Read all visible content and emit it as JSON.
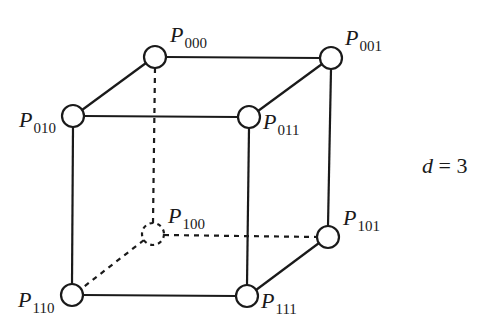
{
  "diagram": {
    "type": "hypercube",
    "dimension_label": {
      "var": "d",
      "op": " = ",
      "value": "3"
    },
    "colors": {
      "stroke": "#1a1a1a",
      "node_fill": "#ffffff",
      "background": "#ffffff"
    },
    "nodes": [
      {
        "id": "P000",
        "letter": "P",
        "sub": "000",
        "x": 155,
        "y": 57,
        "hidden": false
      },
      {
        "id": "P001",
        "letter": "P",
        "sub": "001",
        "x": 331,
        "y": 58,
        "hidden": false
      },
      {
        "id": "P010",
        "letter": "P",
        "sub": "010",
        "x": 73,
        "y": 116,
        "hidden": false
      },
      {
        "id": "P011",
        "letter": "P",
        "sub": "011",
        "x": 249,
        "y": 117,
        "hidden": false
      },
      {
        "id": "P100",
        "letter": "P",
        "sub": "100",
        "x": 153,
        "y": 234,
        "hidden": true
      },
      {
        "id": "P101",
        "letter": "P",
        "sub": "101",
        "x": 328,
        "y": 237,
        "hidden": false
      },
      {
        "id": "P110",
        "letter": "P",
        "sub": "110",
        "x": 72,
        "y": 295,
        "hidden": false
      },
      {
        "id": "P111",
        "letter": "P",
        "sub": "111",
        "x": 247,
        "y": 296,
        "hidden": false
      }
    ],
    "edges": [
      {
        "from": "P000",
        "to": "P001",
        "style": "solid"
      },
      {
        "from": "P000",
        "to": "P010",
        "style": "solid"
      },
      {
        "from": "P001",
        "to": "P011",
        "style": "solid"
      },
      {
        "from": "P010",
        "to": "P011",
        "style": "solid"
      },
      {
        "from": "P010",
        "to": "P110",
        "style": "solid"
      },
      {
        "from": "P011",
        "to": "P111",
        "style": "solid"
      },
      {
        "from": "P001",
        "to": "P101",
        "style": "solid"
      },
      {
        "from": "P110",
        "to": "P111",
        "style": "solid"
      },
      {
        "from": "P111",
        "to": "P101",
        "style": "solid"
      },
      {
        "from": "P000",
        "to": "P100",
        "style": "dashed"
      },
      {
        "from": "P100",
        "to": "P101",
        "style": "dashed"
      },
      {
        "from": "P100",
        "to": "P110",
        "style": "dashed"
      }
    ]
  }
}
